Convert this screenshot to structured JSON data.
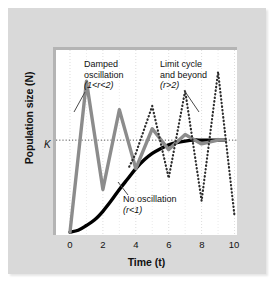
{
  "figure": {
    "background": "#ffffff",
    "card_color": "#d9d9d9",
    "plot_background": "#ffffff"
  },
  "axes": {
    "ylabel": "Population size (N)",
    "xlabel": "Time (t)",
    "carrying_capacity_label": "K",
    "xticks": [
      "0",
      "2",
      "4",
      "6",
      "8",
      "10"
    ]
  },
  "annotations": {
    "damped": {
      "line1": "Damped",
      "line2": "oscillation",
      "line3": "(1<r<2)"
    },
    "limit": {
      "line1": "Limit cycle",
      "line2": "and beyond",
      "line3": "(r>2)"
    },
    "nooscillation": {
      "line1": "No oscillation",
      "line2": "(r<1)"
    }
  },
  "chart_data": {
    "type": "line",
    "title": "",
    "xlabel": "Time (t)",
    "ylabel": "Population size (N)",
    "xlim": [
      -0.85,
      10.15
    ],
    "ylim": [
      0,
      1.95
    ],
    "grid": true,
    "grid_axis": "x",
    "legend": "none",
    "reference_lines": [
      {
        "name": "K",
        "axis": "y",
        "value": 1.0,
        "style": "dotted",
        "color": "#555555",
        "label": "K"
      }
    ],
    "series": [
      {
        "name": "No oscillation (r<1)",
        "color": "#000000",
        "style": "solid",
        "width": 3.4,
        "x": [
          0,
          0.5,
          1.0,
          1.5,
          2.0,
          2.5,
          3.0,
          3.5,
          4.0,
          4.5,
          5.0,
          5.5,
          6.0,
          6.5,
          7.0,
          7.5,
          8.0,
          8.5,
          9.0,
          9.4
        ],
        "y": [
          0.03,
          0.05,
          0.1,
          0.16,
          0.25,
          0.36,
          0.48,
          0.59,
          0.7,
          0.79,
          0.86,
          0.91,
          0.95,
          0.975,
          0.99,
          1.0,
          1.0,
          1.0,
          1.0,
          1.0
        ]
      },
      {
        "name": "Damped oscillation (1<r<2)",
        "color": "#8c8c8c",
        "style": "solid",
        "width": 3.4,
        "x": [
          0,
          1.0,
          2.0,
          3.0,
          4.0,
          5.0,
          6.0,
          7.0,
          8.0,
          9.0,
          9.4
        ],
        "y": [
          0.03,
          1.62,
          0.48,
          1.32,
          0.7,
          1.12,
          0.9,
          1.06,
          0.96,
          1.0,
          1.0
        ]
      },
      {
        "name": "Limit cycle and beyond (r>2)",
        "color": "#2b2b2b",
        "style": "dotted",
        "width": 2.2,
        "x": [
          3.6,
          4.0,
          5.0,
          6.0,
          7.0,
          8.0,
          9.0,
          10.0
        ],
        "y": [
          0.72,
          0.86,
          1.36,
          0.6,
          1.52,
          0.36,
          1.72,
          0.2
        ]
      }
    ]
  }
}
